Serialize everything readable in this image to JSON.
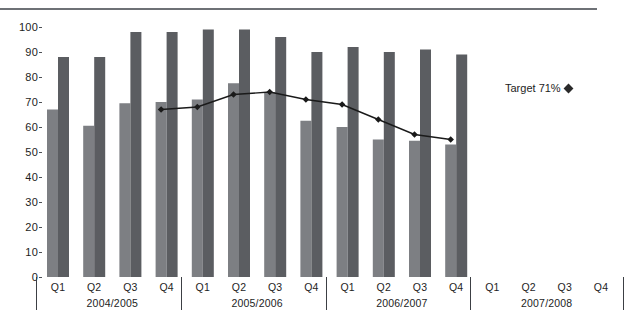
{
  "chart_data": {
    "type": "bar",
    "title": "",
    "subtitle": "",
    "xlabel": "",
    "ylabel": "",
    "ylim": [
      0,
      100
    ],
    "ytick_values": [
      0,
      10,
      20,
      30,
      40,
      50,
      60,
      70,
      80,
      90,
      100
    ],
    "ytick_labels": [
      "0",
      "10",
      "20",
      "30",
      "40",
      "50",
      "60",
      "70",
      "80",
      "90",
      "100"
    ],
    "grid": false,
    "legend_position": "right",
    "categories": [
      "Q1",
      "Q2",
      "Q3",
      "Q4",
      "Q1",
      "Q2",
      "Q3",
      "Q4",
      "Q1",
      "Q2",
      "Q3",
      "Q4",
      "Q1",
      "Q2",
      "Q3",
      "Q4"
    ],
    "group_labels": [
      "2004/2005",
      "2005/2006",
      "2006/2007",
      "2007/2008"
    ],
    "group_size": 4,
    "series": [
      {
        "name": "light-bar-series",
        "type": "bar",
        "color": "#7d7f83",
        "values": [
          67,
          60.5,
          69.5,
          70,
          71,
          77.5,
          74,
          62.5,
          60,
          55,
          54.5,
          53,
          null,
          null,
          null,
          null
        ]
      },
      {
        "name": "dark-bar-series",
        "type": "bar",
        "color": "#5b5d61",
        "values": [
          88,
          88,
          98,
          98,
          99,
          99,
          96,
          90,
          92,
          90,
          91,
          89,
          null,
          null,
          null,
          null
        ]
      },
      {
        "name": "Target 71%",
        "type": "line",
        "color": "#1a1a1a",
        "marker": "diamond",
        "values": [
          null,
          null,
          null,
          67,
          68,
          73,
          74,
          71,
          69,
          63,
          57,
          55,
          null,
          null,
          null,
          null
        ]
      }
    ],
    "annotations": []
  },
  "legend": {
    "label": "Target 71%",
    "marker": "diamond-marker"
  },
  "axis": {
    "y_max_label": "100",
    "y_min_label": "0"
  }
}
